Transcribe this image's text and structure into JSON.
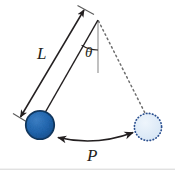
{
  "figure": {
    "name": "simple-pendulum-diagram",
    "background_color": "#ffffff",
    "width": 175,
    "height": 171
  },
  "labels": {
    "length": "L",
    "angle": "θ",
    "displacement": "P"
  },
  "label_meanings": {
    "length": "Pendulum rod length",
    "angle": "Angular displacement from vertical",
    "displacement": "Horizontal swing distance"
  },
  "colors": {
    "bob_fill": "#1f62ab",
    "bob_stroke": "#123a63",
    "ghost_fill": "#dce8f6",
    "ghost_stroke": "#2a4f8f",
    "line": "#231f20",
    "vertical_guide": "#8d8d8d",
    "dashed_path": "#6e6e6e",
    "label_text": "#231f20"
  },
  "geometry": {
    "pivot": {
      "x": 98,
      "y": 20
    },
    "bob_displaced": {
      "cx": 40,
      "cy": 125,
      "r": 14
    },
    "bob_rest": {
      "cx": 148,
      "cy": 127,
      "r": 14
    },
    "vertical_guide_end": {
      "x": 98,
      "y": 73
    },
    "length_arrow_start": {
      "x": 84,
      "y": 10
    },
    "length_arrow_end": {
      "x": 20,
      "y": 118
    },
    "angle_arc_radius": 30,
    "displacement_arrow_start": {
      "x": 57,
      "y": 138
    },
    "displacement_arrow_end": {
      "x": 134,
      "y": 132
    }
  },
  "elements": {
    "pendulum_rod": "pendulum-rod",
    "length_dimension": "length-dimension-arrow",
    "angle_arc": "angle-arc",
    "vertical_reference": "vertical-reference-line",
    "swing_path": "dashed-swing-path",
    "displacement_arrow": "displacement-arrow"
  }
}
